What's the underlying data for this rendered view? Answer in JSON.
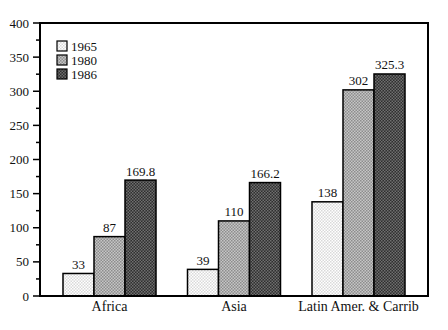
{
  "figure": {
    "background": "#ffffff",
    "frame_color": "#000000"
  },
  "chart_data": {
    "type": "bar",
    "title": "",
    "xlabel": "",
    "ylabel": "",
    "categories": [
      "Africa",
      "Asia",
      "Latin Amer. & Carrib"
    ],
    "series": [
      {
        "name": "1965",
        "values": [
          33,
          39,
          138
        ],
        "fill_base": "#ffffff",
        "fill_check": "#d9d9d9"
      },
      {
        "name": "1980",
        "values": [
          87,
          110,
          302
        ],
        "fill_base": "#c6c6c6",
        "fill_check": "#8d8d8d"
      },
      {
        "name": "1986",
        "values": [
          169.8,
          166.2,
          325.3
        ],
        "fill_base": "#2f2f2f",
        "fill_check": "#6f6f6f"
      }
    ],
    "value_labels_shown": true,
    "ylim": [
      0,
      400
    ],
    "ytick_step": 50,
    "yminor_step": 25,
    "ytick_labels": [
      "0",
      "50",
      "100",
      "150",
      "200",
      "250",
      "300",
      "350",
      "400"
    ],
    "grid": false,
    "bar_outline": "#000000",
    "legend": {
      "position": "top-left",
      "entries": [
        "1965",
        "1980",
        "1986"
      ]
    }
  }
}
